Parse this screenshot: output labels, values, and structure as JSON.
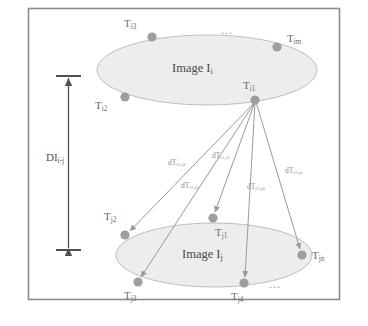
{
  "figure": {
    "type": "diagram",
    "frame": {
      "border_color": "#8c8c8c",
      "background": "#ffffff"
    },
    "palette": {
      "node_fill": "#9e9e9e",
      "ellipse_fill": "#ededed",
      "ellipse_stroke": "#b5b5b5",
      "arrow_stroke": "#9a9a9a",
      "dimension_stroke": "#4f4f4f",
      "text": "#6b6b6b"
    }
  },
  "planes": [
    {
      "id": "plane-i",
      "label_main": "Image I",
      "label_sub": "i",
      "label_text": "Image Ii",
      "cx": 207,
      "cy": 70,
      "rx": 110,
      "ry": 35
    },
    {
      "id": "plane-j",
      "label_main": "Image I",
      "label_sub": "j",
      "label_text": "Image Ij",
      "cx": 214,
      "cy": 255,
      "rx": 98,
      "ry": 32
    }
  ],
  "nodes": [
    {
      "id": "Ti3",
      "base": "T",
      "sub": "i3",
      "text": "Ti3",
      "x": 152,
      "y": 37,
      "lx": 124,
      "ly": 24,
      "plane": "plane-i"
    },
    {
      "id": "Tim",
      "base": "T",
      "sub": "im",
      "text": "Tim",
      "x": 277,
      "y": 47,
      "lx": 287,
      "ly": 38,
      "plane": "plane-i"
    },
    {
      "id": "Ti2",
      "base": "T",
      "sub": "i2",
      "text": "Ti2",
      "x": 125,
      "y": 97,
      "lx": 95,
      "ly": 103,
      "plane": "plane-i"
    },
    {
      "id": "Ti1",
      "base": "T",
      "sub": "i1",
      "text": "Ti1",
      "x": 255,
      "y": 100,
      "lx": 243,
      "ly": 82,
      "plane": "plane-i"
    },
    {
      "id": "Tj2",
      "base": "T",
      "sub": "j2",
      "text": "Tj2",
      "x": 125,
      "y": 235,
      "lx": 103,
      "ly": 213,
      "plane": "plane-j"
    },
    {
      "id": "Tj1",
      "base": "T",
      "sub": "j1",
      "text": "Tj1",
      "x": 213,
      "y": 218,
      "lx": 215,
      "ly": 228,
      "plane": "plane-j"
    },
    {
      "id": "Tj3",
      "base": "T",
      "sub": "j3",
      "text": "Tj3",
      "x": 138,
      "y": 282,
      "lx": 124,
      "ly": 291,
      "plane": "plane-j"
    },
    {
      "id": "Tj4",
      "base": "T",
      "sub": "j4",
      "text": "Tj4",
      "x": 244,
      "y": 283,
      "lx": 231,
      "ly": 292,
      "plane": "plane-j"
    },
    {
      "id": "Tjn",
      "base": "T",
      "sub": "jn",
      "text": "Tjn",
      "x": 302,
      "y": 255,
      "lx": 312,
      "ly": 255,
      "plane": "plane-j"
    }
  ],
  "edges": [
    {
      "id": "e-j2",
      "from": "Ti1",
      "to": "Tj2",
      "base": "dT",
      "sub": "i1-j2",
      "text": "dTi1-j2",
      "lx": 168,
      "ly": 159
    },
    {
      "id": "e-j3",
      "from": "Ti1",
      "to": "Tj3",
      "base": "dT",
      "sub": "i1-j3",
      "text": "dTi1-j3",
      "lx": 181,
      "ly": 182
    },
    {
      "id": "e-j1",
      "from": "Ti1",
      "to": "Tj1",
      "base": "dT",
      "sub": "i1-j1",
      "text": "dTi1-j1",
      "lx": 212,
      "ly": 152
    },
    {
      "id": "e-j4",
      "from": "Ti1",
      "to": "Tj4",
      "base": "dT",
      "sub": "i1-j4",
      "text": "dTi1-j4",
      "lx": 247,
      "ly": 183
    },
    {
      "id": "e-jn",
      "from": "Ti1",
      "to": "Tjn",
      "base": "dT",
      "sub": "i1-jn",
      "text": "dTi1-jn",
      "lx": 285,
      "ly": 167
    }
  ],
  "dimension": {
    "id": "DIi-j",
    "base": "DI",
    "sub": "i-j",
    "text": "DIi-j",
    "x": 68,
    "y1": 76,
    "y2": 250,
    "label_x": 46,
    "label_y": 157
  },
  "ellipses_dots": [
    {
      "id": "dots-top",
      "text": "...",
      "x": 221,
      "y": 27
    },
    {
      "id": "dots-bottom",
      "text": "...",
      "x": 269,
      "y": 281
    }
  ]
}
